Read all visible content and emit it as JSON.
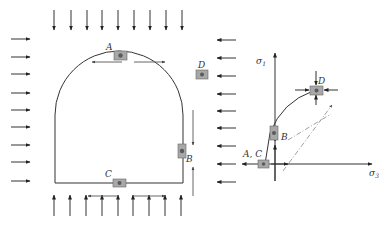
{
  "figure": {
    "colors": {
      "line": "#333333",
      "element_fill": "#a8a8a8",
      "element_core": "#5a5a5a",
      "dashed": "#888888"
    }
  },
  "tunnel": {
    "points": [
      {
        "id": "A",
        "label": "A"
      },
      {
        "id": "B",
        "label": "B"
      },
      {
        "id": "C",
        "label": "C"
      },
      {
        "id": "D",
        "label": "D"
      }
    ],
    "load_arrows": {
      "top_count": 9,
      "bottom_count": 9,
      "left_count": 9,
      "right_count": 9
    }
  },
  "stress_path": {
    "y_axis_label": "σ",
    "y_axis_sub": "1",
    "x_axis_label": "σ",
    "x_axis_sub": "3",
    "labels": {
      "ac": "A, C",
      "b": "B",
      "d": "D"
    }
  }
}
